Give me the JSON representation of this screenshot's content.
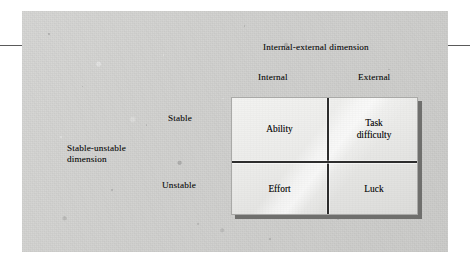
{
  "figure": {
    "top_axis_title": "Internal-external dimension",
    "top_axis_labels": {
      "internal": "Internal",
      "external": "External"
    },
    "left_axis_title": "Stable-unstable\ndimension",
    "left_axis_labels": {
      "stable": "Stable",
      "unstable": "Unstable"
    },
    "matrix": {
      "top_left": "Ability",
      "top_right": "Task\ndifficulty",
      "bottom_left": "Effort",
      "bottom_right": "Luck"
    }
  },
  "colors": {
    "panel_background": "#d2d2d0",
    "matrix_fill": "#ebebe9",
    "divider": "#2d2d2d",
    "shadow": "#6f6f6d",
    "text": "#131313",
    "rule": "#5a5a5a"
  }
}
